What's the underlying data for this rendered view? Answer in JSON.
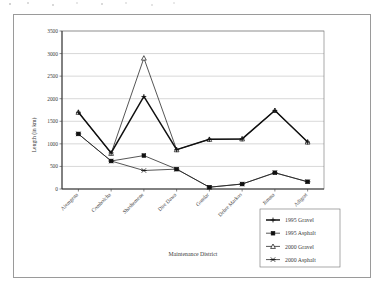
{
  "figure": {
    "has_outer_frame": true,
    "background_color": "#ffffff"
  },
  "chart_data": {
    "type": "line",
    "title": "",
    "xlabel": "Maintenance District",
    "ylabel": "Length (in km)",
    "ylim": [
      0,
      3500
    ],
    "ytick_step": 500,
    "yticks": [
      "0",
      "500",
      "1000",
      "1500",
      "2000",
      "2500",
      "3000",
      "3500"
    ],
    "grid": true,
    "grid_axis": "y",
    "legend_position": "bottom-right",
    "categories": [
      "Alemgena",
      "Combolcha",
      "Shashemene",
      "Dire Dawa",
      "Gondar",
      "Debre Markos",
      "Jimma",
      "Adigrat"
    ],
    "series": [
      {
        "name": "1995 Gravel",
        "marker": "plus",
        "line": "thick",
        "values": [
          1700,
          800,
          2050,
          870,
          1100,
          1110,
          1740,
          1040
        ]
      },
      {
        "name": "1995 Asphalt",
        "marker": "filled-square",
        "line": "thin",
        "values": [
          1220,
          620,
          740,
          440,
          40,
          110,
          360,
          160
        ]
      },
      {
        "name": "2000 Gravel",
        "marker": "open-triangle",
        "line": "thin",
        "values": [
          1700,
          790,
          2900,
          870,
          1100,
          1110,
          1740,
          1040
        ]
      },
      {
        "name": "2000 Asphalt",
        "marker": "x-cross",
        "line": "thin",
        "values": [
          1220,
          620,
          410,
          440,
          40,
          110,
          360,
          160
        ]
      }
    ]
  },
  "legend": {
    "items": [
      {
        "label": "1995 Gravel",
        "marker": "plus"
      },
      {
        "label": "1995 Asphalt",
        "marker": "filled-square"
      },
      {
        "label": "2000 Gravel",
        "marker": "open-triangle"
      },
      {
        "label": "2000 Asphalt",
        "marker": "x-cross"
      }
    ]
  }
}
